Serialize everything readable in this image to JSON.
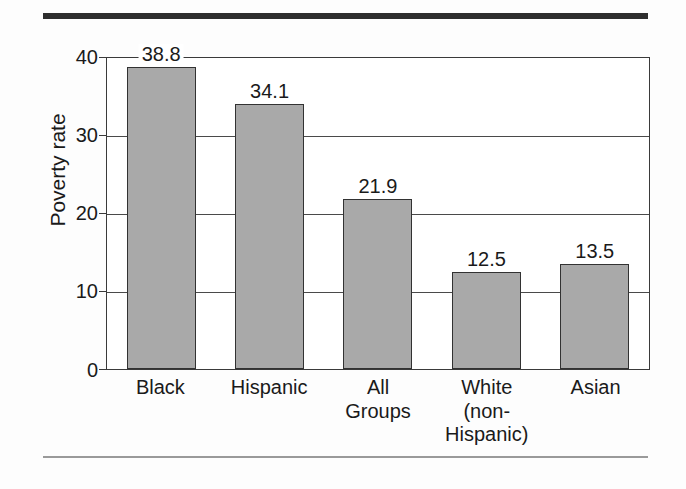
{
  "chart_data": {
    "type": "bar",
    "title": "",
    "subtitle": "",
    "xlabel": "",
    "ylabel": "Poverty rate",
    "ylim": [
      0,
      40
    ],
    "yticks": [
      "0",
      "10",
      "20",
      "30",
      "40"
    ],
    "grid": true,
    "legend": null,
    "categories": [
      "Black",
      "Hispanic",
      "All Groups",
      "White (non-Hispanic)",
      "Asian"
    ],
    "category_lines": [
      [
        "Black"
      ],
      [
        "Hispanic"
      ],
      [
        "All",
        "Groups"
      ],
      [
        "White",
        "(non-",
        "Hispanic)"
      ],
      [
        "Asian"
      ]
    ],
    "values": [
      38.8,
      34.1,
      21.9,
      12.5,
      13.5
    ],
    "value_labels": [
      "38.8",
      "34.1",
      "21.9",
      "12.5",
      "13.5"
    ],
    "bar_fill_color": "#a9a9a9",
    "bar_edge_color": "#323232",
    "axis_color": "#3a3a3a",
    "text_color": "#1a1a1a",
    "background_color": "#fdfdfd"
  },
  "decor": {
    "top_rule_color": "#2e2e2e",
    "bottom_rule_color": "#9a9a9a"
  }
}
